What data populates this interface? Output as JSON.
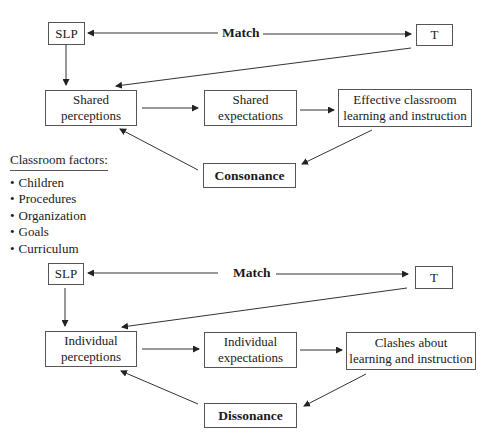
{
  "top_diagram": {
    "slp": "SLP",
    "teacher": "T",
    "match": "Match",
    "perceptions": [
      "Shared",
      "perceptions"
    ],
    "expectations": [
      "Shared",
      "expectations"
    ],
    "outcome": [
      "Effective classroom",
      "learning and instruction"
    ],
    "result": "Consonance"
  },
  "classroom_factors": {
    "title": "Classroom factors:",
    "items": [
      "Children",
      "Procedures",
      "Organization",
      "Goals",
      "Curriculum"
    ]
  },
  "bottom_diagram": {
    "slp": "SLP",
    "teacher": "T",
    "match": "Match",
    "perceptions": [
      "Individual",
      "perceptions"
    ],
    "expectations": [
      "Individual",
      "expectations"
    ],
    "outcome": [
      "Clashes about",
      "learning and instruction"
    ],
    "result": "Dissonance"
  }
}
